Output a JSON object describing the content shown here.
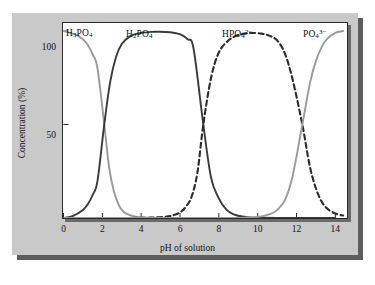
{
  "figure": {
    "background_color": "#c9c9c9",
    "panel_color": "#ffffff",
    "frame_color": "#2b2b2b"
  },
  "chart_data": {
    "type": "line",
    "title": "",
    "xlabel": "pH of solution",
    "ylabel": "Concentration (%)",
    "xlim": [
      0,
      14.6
    ],
    "ylim": [
      0,
      104
    ],
    "grid": false,
    "legend_position": "inline-above-curves",
    "x_ticks": [
      0,
      2,
      4,
      6,
      8,
      10,
      12,
      14
    ],
    "y_ticks": [
      50,
      100
    ],
    "x_tick_labels": [
      "0",
      "2",
      "4",
      "6",
      "8",
      "10",
      "12",
      "14"
    ],
    "y_tick_labels": [
      "50",
      "100"
    ],
    "pka_values": [
      2.1,
      7.2,
      12.3
    ],
    "annotations": [
      {
        "name": "H3PO4",
        "text_plain": "H3PO4",
        "x": 1.0,
        "y": 104
      },
      {
        "name": "H2PO4-",
        "text_plain": "H2PO4-",
        "x": 4.2,
        "y": 104
      },
      {
        "name": "HPO42-",
        "text_plain": "HPO42-",
        "x": 8.9,
        "y": 104
      },
      {
        "name": "PO43-",
        "text_plain": "PO43-",
        "x": 13.0,
        "y": 104
      }
    ],
    "series": [
      {
        "name": "H3PO4",
        "label_html": "H<sub>3</sub>PO<sub>4</sub>",
        "color": "#9a9a9a",
        "style": "solid",
        "x": [
          0.0,
          0.25,
          0.5,
          0.75,
          1.0,
          1.25,
          1.5,
          1.75,
          2.1,
          2.35,
          2.6,
          2.85,
          3.1,
          3.35,
          3.6,
          4.0,
          4.5,
          5.0,
          6.0,
          8.0,
          10.0,
          12.0,
          14.0
        ],
        "y": [
          100,
          99.3,
          98.5,
          97.4,
          95.5,
          92.5,
          87.5,
          80.0,
          50.0,
          27.0,
          14.0,
          6.8,
          3.2,
          1.8,
          1.0,
          0.4,
          0.15,
          0.05,
          0,
          0,
          0,
          0,
          0
        ]
      },
      {
        "name": "H2PO4-",
        "label_html": "H<sub>2</sub>PO<sub>4</sub><sup>&minus;</sup>",
        "color": "#3a3a3a",
        "style": "solid",
        "x": [
          0.0,
          0.5,
          1.0,
          1.25,
          1.5,
          1.75,
          2.1,
          2.4,
          2.7,
          3.0,
          3.4,
          3.8,
          4.5,
          5.0,
          5.5,
          5.8,
          6.1,
          6.4,
          6.7,
          7.2,
          7.6,
          8.0,
          8.4,
          8.8,
          9.2,
          9.6,
          10.2,
          11.0,
          12.0,
          14.0
        ],
        "y": [
          0,
          1.2,
          4.3,
          7.3,
          12.3,
          19.8,
          50.0,
          72.5,
          86.0,
          93.0,
          97.0,
          98.6,
          99.5,
          99.6,
          99.3,
          98.8,
          97.8,
          95.5,
          90.5,
          50.0,
          21.5,
          10.5,
          4.3,
          1.8,
          0.8,
          0.3,
          0.12,
          0.04,
          0,
          0
        ]
      },
      {
        "name": "HPO42-",
        "label_html": "HPO<sub>4</sub><sup>2&minus;</sup>",
        "color": "#2b2b2b",
        "style": "dashed",
        "x": [
          0.0,
          3.0,
          4.5,
          5.2,
          5.6,
          6.0,
          6.3,
          6.6,
          6.9,
          7.2,
          7.6,
          8.0,
          8.5,
          9.0,
          9.6,
          10.2,
          10.6,
          11.0,
          11.4,
          11.8,
          12.3,
          12.7,
          13.1,
          13.5,
          14.0,
          14.4
        ],
        "y": [
          0,
          0,
          0.2,
          0.6,
          1.3,
          3.0,
          6.0,
          11.5,
          24.5,
          50.0,
          75.0,
          88.5,
          95.0,
          97.8,
          98.9,
          98.6,
          97.5,
          95.0,
          88.0,
          74.0,
          50.0,
          27.0,
          13.0,
          5.8,
          2.4,
          1.3
        ]
      },
      {
        "name": "PO43-",
        "label_html": "PO<sub>4</sub><sup>3&minus;</sup>",
        "color": "#9a9a9a",
        "style": "solid",
        "x": [
          0.0,
          8.0,
          9.5,
          10.2,
          10.6,
          11.0,
          11.4,
          11.8,
          12.3,
          12.7,
          13.0,
          13.3,
          13.6,
          14.0,
          14.4
        ],
        "y": [
          0,
          0,
          0.3,
          0.9,
          1.9,
          4.2,
          9.5,
          22.5,
          50.0,
          72.5,
          84.0,
          91.5,
          96.0,
          99.0,
          100
        ]
      }
    ]
  },
  "axes": {
    "ylabel": "Concentration (%)",
    "xlabel": "pH of solution"
  }
}
